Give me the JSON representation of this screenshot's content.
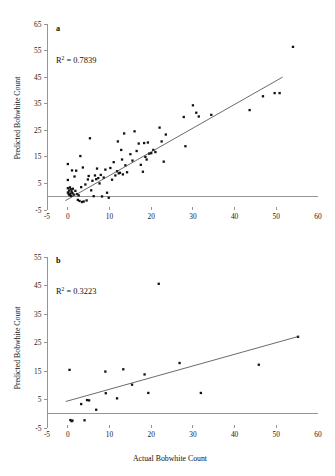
{
  "figure": {
    "axis_title_x": "Actual Bobwhite Count",
    "axis_title_y": "Predicted Bobwhite Count",
    "accent_color": "#111111",
    "axis_color": "#8a8a8a"
  },
  "chart_data": [
    {
      "type": "scatter",
      "panel_label": "a",
      "title": "",
      "annotation": "R2 = 0.7839",
      "r_squared": 0.7839,
      "xlabel": "Actual Bobwhite Count",
      "ylabel": "Predicted Bobwhite Count",
      "xlim": [
        -5,
        60
      ],
      "ylim": [
        -5,
        65
      ],
      "xticks": [
        -5,
        0,
        10,
        20,
        30,
        40,
        50,
        60
      ],
      "yticks": [
        -5,
        5,
        15,
        25,
        35,
        45,
        55,
        65
      ],
      "grid": false,
      "legend": "none",
      "fit_line": {
        "x": [
          -0.6,
          51.5
        ],
        "y": [
          -1.5,
          45.0
        ]
      },
      "points": [
        [
          0.0,
          12.3
        ],
        [
          0.0,
          6.3
        ],
        [
          0.0,
          3.2
        ],
        [
          0.0,
          1.6
        ],
        [
          0.2,
          1.0
        ],
        [
          0.3,
          2.3
        ],
        [
          0.4,
          0.6
        ],
        [
          0.5,
          3.5
        ],
        [
          0.6,
          1.2
        ],
        [
          0.7,
          2.8
        ],
        [
          0.8,
          0.3
        ],
        [
          0.9,
          2.0
        ],
        [
          1.0,
          9.9
        ],
        [
          1.1,
          1.4
        ],
        [
          1.2,
          3.0
        ],
        [
          1.4,
          0.8
        ],
        [
          1.6,
          7.6
        ],
        [
          1.8,
          2.2
        ],
        [
          2.0,
          9.8
        ],
        [
          2.2,
          1.0
        ],
        [
          2.4,
          -1.2
        ],
        [
          2.6,
          0.5
        ],
        [
          2.8,
          -1.6
        ],
        [
          3.0,
          15.3
        ],
        [
          3.2,
          3.6
        ],
        [
          3.4,
          -2.0
        ],
        [
          3.6,
          11.0
        ],
        [
          3.8,
          -1.8
        ],
        [
          4.2,
          4.6
        ],
        [
          4.5,
          -1.4
        ],
        [
          4.8,
          6.5
        ],
        [
          5.0,
          7.8
        ],
        [
          5.3,
          22.0
        ],
        [
          5.6,
          2.4
        ],
        [
          5.9,
          6.0
        ],
        [
          6.2,
          0.2
        ],
        [
          6.5,
          8.0
        ],
        [
          6.8,
          6.6
        ],
        [
          7.0,
          10.6
        ],
        [
          7.3,
          7.0
        ],
        [
          7.6,
          5.0
        ],
        [
          7.9,
          8.2
        ],
        [
          8.2,
          0.1
        ],
        [
          8.6,
          7.2
        ],
        [
          9.0,
          10.2
        ],
        [
          9.4,
          1.5
        ],
        [
          9.8,
          -0.4
        ],
        [
          10.2,
          10.8
        ],
        [
          10.6,
          6.4
        ],
        [
          11.0,
          13.0
        ],
        [
          11.4,
          8.0
        ],
        [
          11.8,
          9.6
        ],
        [
          12.0,
          20.8
        ],
        [
          12.2,
          8.8
        ],
        [
          12.5,
          9.0
        ],
        [
          12.8,
          17.6
        ],
        [
          13.0,
          14.0
        ],
        [
          13.2,
          8.4
        ],
        [
          13.5,
          23.8
        ],
        [
          13.8,
          11.8
        ],
        [
          14.2,
          9.2
        ],
        [
          15.0,
          16.0
        ],
        [
          15.5,
          13.6
        ],
        [
          16.0,
          24.6
        ],
        [
          16.5,
          17.2
        ],
        [
          17.0,
          20.0
        ],
        [
          17.5,
          12.0
        ],
        [
          18.0,
          9.4
        ],
        [
          18.3,
          20.2
        ],
        [
          18.6,
          15.0
        ],
        [
          18.9,
          14.0
        ],
        [
          19.2,
          20.4
        ],
        [
          19.5,
          16.2
        ],
        [
          20.0,
          16.4
        ],
        [
          20.5,
          17.6
        ],
        [
          21.0,
          16.8
        ],
        [
          22.0,
          26.0
        ],
        [
          22.5,
          20.8
        ],
        [
          23.0,
          13.2
        ],
        [
          23.5,
          23.4
        ],
        [
          27.8,
          30.0
        ],
        [
          28.2,
          19.0
        ],
        [
          30.0,
          34.4
        ],
        [
          30.8,
          31.6
        ],
        [
          31.4,
          30.2
        ],
        [
          34.4,
          30.8
        ],
        [
          43.6,
          32.6
        ],
        [
          46.8,
          37.8
        ],
        [
          49.6,
          39.0
        ],
        [
          50.8,
          39.0
        ],
        [
          54.0,
          56.4
        ]
      ]
    },
    {
      "type": "scatter",
      "panel_label": "b",
      "title": "",
      "annotation": "R2 = 0.3223",
      "r_squared": 0.3223,
      "xlabel": "Actual Bobwhite Count",
      "ylabel": "Predicted Bobwhite Count",
      "xlim": [
        -5,
        60
      ],
      "ylim": [
        -5,
        55
      ],
      "xticks": [
        -5,
        0,
        10,
        20,
        30,
        40,
        50,
        60
      ],
      "yticks": [
        -5,
        5,
        15,
        25,
        35,
        45,
        55
      ],
      "grid": false,
      "legend": "none",
      "fit_line": {
        "x": [
          -0.5,
          55.5
        ],
        "y": [
          4.3,
          27.2
        ]
      },
      "points": [
        [
          0.4,
          15.4
        ],
        [
          0.6,
          -2.2
        ],
        [
          0.9,
          -2.6
        ],
        [
          1.1,
          -2.4
        ],
        [
          3.2,
          3.4
        ],
        [
          4.0,
          -2.3
        ],
        [
          4.6,
          4.8
        ],
        [
          5.1,
          4.7
        ],
        [
          6.8,
          1.4
        ],
        [
          9.0,
          14.8
        ],
        [
          9.1,
          7.2
        ],
        [
          11.8,
          5.4
        ],
        [
          13.3,
          15.6
        ],
        [
          15.4,
          10.2
        ],
        [
          18.4,
          13.8
        ],
        [
          19.3,
          7.3
        ],
        [
          21.8,
          45.6
        ],
        [
          26.8,
          17.8
        ],
        [
          31.9,
          7.3
        ],
        [
          45.8,
          17.2
        ],
        [
          55.2,
          27.0
        ]
      ]
    }
  ]
}
